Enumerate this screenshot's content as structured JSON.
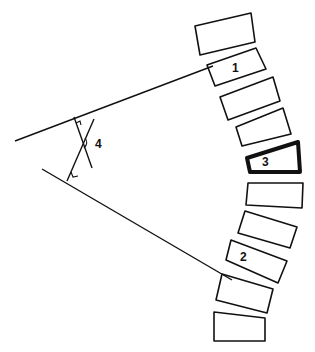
{
  "diagram": {
    "stroke_color": "#111111",
    "background": "#ffffff",
    "vertebrae": [
      {
        "id": "v1",
        "label": "",
        "points": "195,26 251,13 255,42 200,55",
        "emphasis": false
      },
      {
        "id": "v2",
        "label": "1",
        "points": "207,65 256,48 266,69 215,86",
        "emphasis": false,
        "label_pos": [
          232,
          72
        ]
      },
      {
        "id": "v3",
        "label": "",
        "points": "220,97 273,77 280,101 228,120",
        "emphasis": false
      },
      {
        "id": "v4",
        "label": "",
        "points": "236,127 283,108 291,134 242,146",
        "emphasis": false
      },
      {
        "id": "v5",
        "label": "3",
        "points": "247,158 298,142 300,172 250,172",
        "emphasis": true,
        "label_pos": [
          262,
          166
        ]
      },
      {
        "id": "v6",
        "label": "",
        "points": "248,183 303,183 302,208 246,205",
        "emphasis": false
      },
      {
        "id": "v7",
        "label": "",
        "points": "245,211 297,227 290,248 238,233",
        "emphasis": false
      },
      {
        "id": "v8",
        "label": "2",
        "points": "231,240 287,261 278,283 226,260",
        "emphasis": false,
        "label_pos": [
          240,
          261
        ]
      },
      {
        "id": "v9",
        "label": "",
        "points": "222,274 273,289 267,313 216,300",
        "emphasis": false
      },
      {
        "id": "v10",
        "label": "",
        "points": "214,312 265,318 265,341 214,341",
        "emphasis": false
      }
    ],
    "lines": {
      "upper_endplate_line": {
        "x1": 15,
        "y1": 141,
        "x2": 213,
        "y2": 66
      },
      "lower_endplate_line": {
        "x1": 42,
        "y1": 169,
        "x2": 232,
        "y2": 280
      },
      "perpendicular_upper": {
        "x1": 74,
        "y1": 117,
        "x2": 92,
        "y2": 168
      },
      "perpendicular_lower": {
        "x1": 67,
        "y1": 181,
        "x2": 94,
        "y2": 119
      }
    },
    "angle_label": {
      "text": "4",
      "x": 95,
      "y": 148
    },
    "labels": {
      "v2": "1",
      "v5": "3",
      "v8": "2",
      "angle": "4"
    }
  }
}
